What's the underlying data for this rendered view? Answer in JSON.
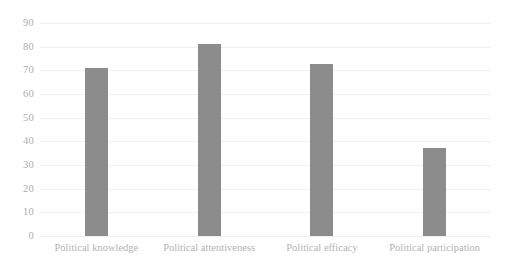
{
  "chart_data": {
    "type": "bar",
    "title": "",
    "subtitle": "",
    "xlabel": "",
    "ylabel": "",
    "categories": [
      "Political knowledge",
      "Political attentiveness",
      "Political efficacy",
      "Political participation"
    ],
    "values": [
      71,
      81,
      72.5,
      37
    ],
    "ylim": [
      0,
      90
    ],
    "ytick_labels": [
      "0",
      "10",
      "20",
      "30",
      "40",
      "50",
      "60",
      "70",
      "80",
      "90"
    ],
    "ytick_values": [
      0,
      10,
      20,
      30,
      40,
      50,
      60,
      70,
      80,
      90
    ],
    "grid": "horizontal",
    "legend": "none",
    "series": [
      {
        "name": "",
        "values": [
          71,
          81,
          72.5,
          37
        ]
      }
    ]
  },
  "style": {
    "bar_color": "#8c8c8c",
    "gridline_color": "#f2f2f3",
    "baseline_color": "#ededee",
    "tick_label_color": "#aeaeae",
    "category_label_color": "#b3b3b3",
    "background_color": "#ffffff"
  }
}
